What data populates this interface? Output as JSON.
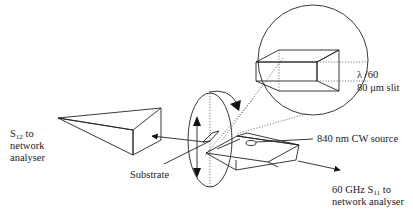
{
  "diagram": {
    "type": "experimental-setup",
    "nodes": [
      {
        "id": "horn",
        "label": "S12 to network analyser",
        "kind": "horn-antenna"
      },
      {
        "id": "substrate",
        "label": "Substrate",
        "kind": "rotatable-substrate"
      },
      {
        "id": "probe",
        "label": "60 GHz S11 to network analyser",
        "kind": "waveguide-probe"
      },
      {
        "id": "laser",
        "label": "840 nm CW source",
        "kind": "optical-source"
      },
      {
        "id": "slit",
        "label": "λ /60 80 μm slit",
        "kind": "magnified-inset"
      }
    ],
    "edges": [
      {
        "from": "substrate",
        "to": "horn",
        "kind": "arrow"
      },
      {
        "from": "probe",
        "to": "network-analyser",
        "kind": "arrow"
      },
      {
        "from": "probe",
        "to": "slit",
        "kind": "dotted-magnify"
      }
    ]
  },
  "labels": {
    "inset_line1": "λ /60",
    "inset_line2": "80 μm slit",
    "source": "840 nm CW source",
    "s11_line1_pre": "60 GHz S",
    "s11_sub": "11",
    "s11_line1_post": " to",
    "s11_line2": "network analyser",
    "s12_pre": "S",
    "s12_sub": "12",
    "s12_post": " to",
    "s12_line2": "network",
    "s12_line3": "analyser",
    "substrate": "Substrate"
  }
}
